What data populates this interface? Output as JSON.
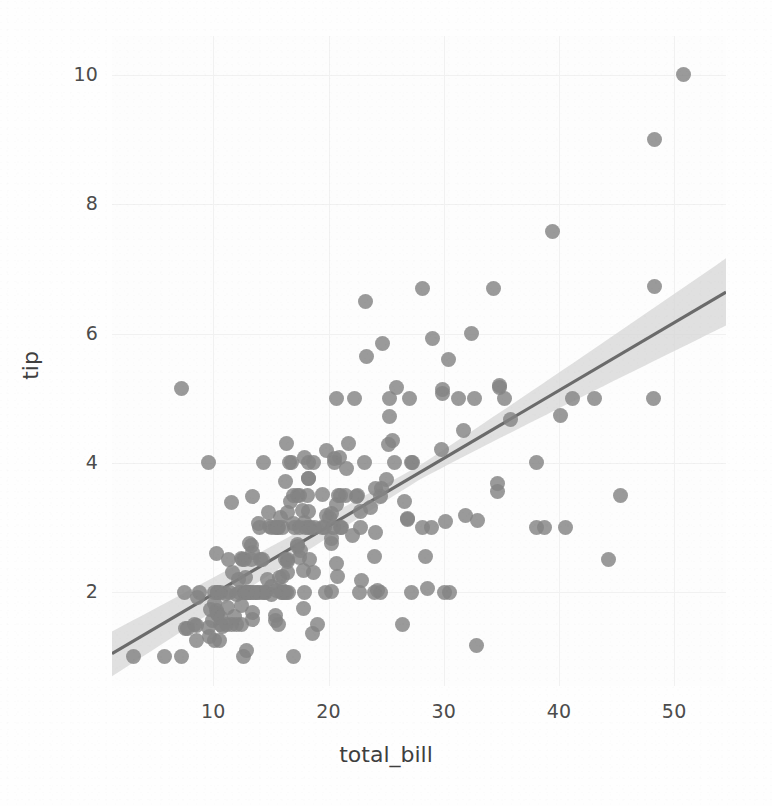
{
  "chart_data": {
    "type": "scatter",
    "title": "",
    "subtitle": "",
    "xlabel": "total_bill",
    "ylabel": "tip",
    "xlim": [
      1.2,
      54.5
    ],
    "ylim": [
      0.55,
      10.6
    ],
    "xticks": [
      10,
      20,
      30,
      40,
      50
    ],
    "xtick_labels": [
      "10",
      "20",
      "30",
      "40",
      "50"
    ],
    "yticks": [
      2,
      4,
      6,
      8,
      10
    ],
    "ytick_labels": [
      "2",
      "4",
      "6",
      "8",
      "10"
    ],
    "grid": true,
    "legend": null,
    "legend_position": "none",
    "style": "whitegrid",
    "marker_color": "#848484",
    "line_color": "#6b6b6b",
    "band_color": "#d8d8d8",
    "background_color": "#fdfdfd",
    "gridline_color": "#f1f1f1",
    "text_color": "#4c4c4c",
    "regression": {
      "kind": "linear-fit-with-95pct-ci",
      "slope": 0.105,
      "intercept": 0.92,
      "x_start": 1.2,
      "x_end": 54.5,
      "y_start": 1.05,
      "y_end": 6.64,
      "ci_half_width_start": 0.3,
      "ci_half_width_end": 0.52,
      "ci_half_width_min": 0.11
    },
    "series": [
      {
        "name": "tips",
        "x": [
          16.99,
          10.34,
          21.01,
          23.68,
          24.59,
          25.29,
          8.77,
          26.88,
          15.04,
          14.78,
          10.27,
          35.26,
          15.42,
          18.43,
          14.83,
          21.58,
          10.33,
          16.29,
          16.97,
          20.65,
          17.92,
          20.29,
          15.77,
          39.42,
          19.82,
          17.81,
          13.37,
          12.69,
          21.7,
          19.65,
          9.55,
          18.35,
          15.06,
          20.69,
          17.78,
          24.06,
          16.31,
          16.93,
          18.69,
          31.27,
          16.04,
          17.46,
          13.94,
          9.68,
          30.4,
          18.29,
          22.23,
          32.4,
          28.55,
          18.04,
          12.54,
          10.29,
          34.81,
          9.94,
          25.56,
          19.49,
          38.01,
          26.41,
          11.24,
          48.27,
          20.29,
          13.81,
          11.02,
          18.29,
          17.59,
          20.08,
          16.45,
          3.07,
          20.23,
          15.01,
          12.02,
          17.07,
          26.86,
          25.28,
          14.73,
          10.51,
          17.92,
          27.2,
          22.76,
          17.29,
          19.44,
          16.66,
          10.07,
          32.68,
          15.98,
          34.83,
          13.03,
          18.28,
          24.71,
          21.16,
          28.97,
          22.49,
          5.75,
          16.32,
          22.75,
          40.17,
          27.28,
          12.03,
          21.01,
          12.46,
          11.35,
          15.38,
          44.3,
          22.42,
          20.92,
          15.36,
          20.49,
          25.21,
          18.24,
          14.31,
          14.0,
          7.25,
          38.07,
          23.95,
          25.71,
          17.31,
          29.93,
          10.65,
          12.43,
          24.08,
          11.69,
          13.42,
          14.26,
          15.95,
          12.48,
          29.8,
          8.52,
          14.52,
          11.38,
          22.82,
          19.08,
          20.27,
          11.17,
          12.26,
          18.26,
          8.51,
          10.33,
          14.15,
          16.0,
          13.16,
          17.47,
          34.3,
          41.19,
          27.05,
          16.43,
          8.35,
          18.64,
          11.87,
          9.78,
          7.51,
          14.07,
          13.13,
          17.26,
          24.55,
          19.77,
          29.85,
          48.17,
          25.0,
          13.39,
          16.49,
          21.5,
          12.66,
          16.21,
          13.81,
          17.51,
          24.52,
          20.76,
          31.71,
          10.59,
          10.63,
          50.81,
          15.81,
          7.25,
          31.85,
          16.82,
          32.9,
          17.89,
          14.48,
          9.6,
          34.63,
          34.65,
          23.33,
          45.35,
          23.17,
          40.55,
          20.69,
          20.9,
          30.46,
          18.15,
          23.1,
          15.69,
          19.81,
          28.44,
          15.48,
          16.58,
          7.56,
          10.34,
          43.11,
          13.0,
          13.51,
          18.71,
          12.74,
          13.0,
          16.4,
          20.53,
          16.47,
          26.59,
          38.73,
          24.27,
          12.76,
          30.06,
          25.89,
          48.33,
          13.27,
          28.17,
          12.9,
          28.15,
          11.59,
          7.74,
          30.14,
          12.16,
          13.42,
          8.58,
          15.98,
          13.42,
          16.27,
          10.09,
          20.45,
          13.28,
          22.12,
          24.01,
          15.69,
          11.61,
          10.77,
          15.53,
          10.07,
          12.6,
          32.83,
          35.83,
          29.03,
          27.18,
          22.67,
          17.82,
          18.78
        ],
        "y": [
          1.01,
          1.66,
          3.5,
          3.31,
          3.61,
          4.71,
          2.0,
          3.12,
          1.96,
          3.23,
          1.71,
          5.0,
          1.57,
          3.0,
          3.02,
          3.92,
          1.67,
          3.71,
          3.5,
          3.35,
          4.08,
          2.75,
          2.23,
          7.58,
          3.18,
          2.34,
          2.0,
          2.0,
          4.3,
          3.0,
          1.45,
          2.5,
          3.0,
          2.45,
          3.27,
          3.6,
          2.0,
          3.07,
          2.31,
          5.0,
          2.24,
          2.54,
          3.06,
          1.32,
          5.6,
          3.0,
          5.0,
          6.0,
          2.05,
          3.0,
          2.5,
          2.6,
          5.2,
          1.56,
          4.34,
          3.51,
          3.0,
          1.5,
          1.76,
          6.73,
          3.21,
          2.0,
          1.98,
          3.76,
          2.64,
          3.15,
          2.47,
          1.0,
          2.01,
          2.09,
          1.97,
          3.0,
          3.14,
          5.0,
          2.2,
          1.25,
          3.08,
          4.0,
          3.0,
          2.71,
          3.0,
          3.4,
          1.83,
          5.0,
          2.03,
          5.17,
          2.0,
          4.0,
          5.85,
          3.0,
          3.0,
          3.5,
          1.0,
          4.3,
          3.25,
          4.73,
          4.0,
          1.5,
          3.0,
          1.5,
          2.5,
          3.0,
          2.5,
          3.48,
          4.08,
          1.64,
          4.06,
          4.29,
          3.76,
          4.0,
          3.0,
          1.0,
          4.0,
          2.55,
          4.0,
          3.5,
          5.07,
          1.5,
          1.8,
          2.92,
          2.31,
          1.68,
          2.5,
          2.0,
          2.52,
          4.2,
          1.48,
          2.0,
          2.0,
          2.18,
          1.5,
          2.83,
          1.5,
          2.0,
          3.25,
          1.25,
          2.0,
          2.0,
          2.0,
          2.75,
          3.5,
          6.7,
          5.0,
          5.0,
          2.3,
          1.5,
          1.36,
          1.63,
          1.73,
          2.0,
          2.5,
          2.0,
          2.74,
          2.0,
          2.0,
          5.14,
          5.0,
          3.75,
          2.61,
          2.0,
          3.5,
          2.5,
          2.0,
          2.0,
          3.0,
          3.48,
          2.24,
          4.5,
          1.61,
          2.0,
          10.0,
          3.16,
          5.15,
          3.18,
          4.0,
          3.11,
          2.0,
          2.0,
          4.0,
          3.55,
          3.68,
          5.65,
          3.5,
          6.5,
          3.0,
          5.0,
          3.5,
          2.0,
          3.5,
          4.0,
          1.5,
          4.19,
          2.56,
          2.02,
          4.0,
          1.44,
          2.0,
          5.0,
          2.0,
          2.0,
          4.0,
          2.0,
          2.0,
          2.5,
          4.0,
          3.23,
          3.41,
          3.0,
          2.03,
          2.23,
          2.0,
          5.16,
          9.0,
          2.5,
          6.7,
          1.1,
          3.0,
          1.5,
          1.44,
          3.09,
          2.2,
          3.48,
          1.92,
          3.0,
          1.58,
          2.5,
          2.0,
          3.0,
          2.72,
          2.88,
          2.0,
          3.0,
          3.39,
          1.47,
          3.0,
          1.25,
          1.0,
          1.17,
          4.67,
          5.92,
          2.0,
          2.0,
          1.75,
          3.0
        ]
      }
    ]
  },
  "axes": {
    "x_tick_labels": [
      "10",
      "20",
      "30",
      "40",
      "50"
    ],
    "y_tick_labels": [
      "2",
      "4",
      "6",
      "8",
      "10"
    ],
    "x_axis_title": "total_bill",
    "y_axis_title": "tip"
  }
}
